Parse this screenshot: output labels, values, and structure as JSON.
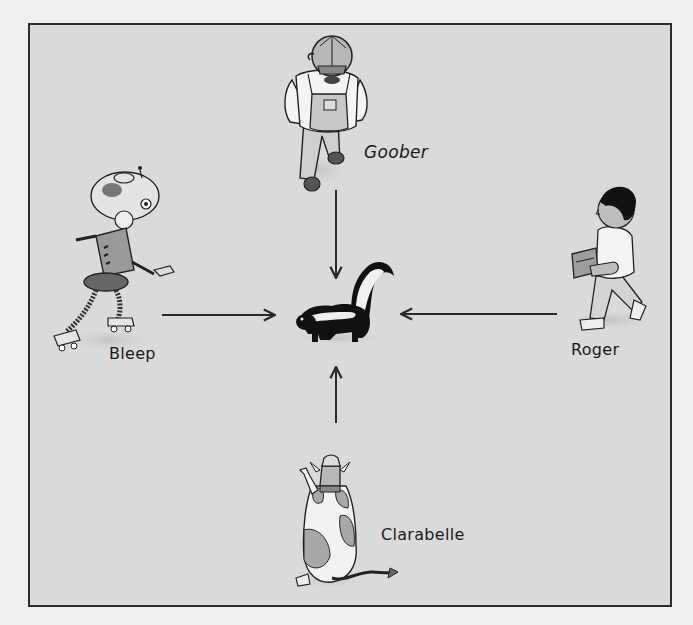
{
  "illustration": {
    "description": "Four characters converge on a skunk in the center, each with an arrow pointing toward it",
    "center": {
      "name": "skunk",
      "label": ""
    },
    "characters": [
      {
        "id": "goober",
        "label": "Goober",
        "position": "top",
        "depiction": "man in cap and overalls, viewed from above",
        "arrow_direction": "down"
      },
      {
        "id": "bleep",
        "label": "Bleep",
        "position": "left",
        "depiction": "robot on roller skates",
        "arrow_direction": "right"
      },
      {
        "id": "roger",
        "label": "Roger",
        "position": "right",
        "depiction": "boy carrying a box, walking left",
        "arrow_direction": "left"
      },
      {
        "id": "clarabelle",
        "label": "Clarabelle",
        "position": "bottom",
        "depiction": "spotted cow viewed from behind",
        "arrow_direction": "up"
      }
    ]
  },
  "colors": {
    "page_bg": "#efefef",
    "frame_bg": "#dadada",
    "frame_border": "#2c2c2c",
    "ink": "#1a1a1a"
  }
}
